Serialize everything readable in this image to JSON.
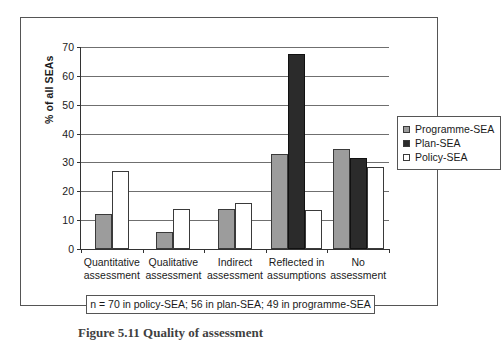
{
  "figure": {
    "caption": "Figure 5.11  Quality of assessment"
  },
  "footnote": {
    "text": "n = 70 in policy-SEA; 56 in plan-SEA; 49 in programme-SEA"
  },
  "legend": {
    "position": "right",
    "items": [
      {
        "label": "Programme-SEA",
        "color": "#9c9c9c",
        "key": "programme"
      },
      {
        "label": "Plan-SEA",
        "color": "#2b2b2b",
        "key": "plan"
      },
      {
        "label": "Policy-SEA",
        "color": "#ffffff",
        "key": "policy"
      }
    ]
  },
  "axes": {
    "y_title": "% of all SEAs",
    "y_ticks": [
      0,
      10,
      20,
      30,
      40,
      50,
      60,
      70
    ]
  },
  "chart_data": {
    "type": "bar",
    "title": "",
    "xlabel": "",
    "ylabel": "% of all SEAs",
    "ylim": [
      0,
      70
    ],
    "ytick_step": 10,
    "grid": true,
    "legend_position": "right",
    "categories": [
      "Quantitative\nassessment",
      "Qualitative\nassessment",
      "Indirect\nassessment",
      "Reflected in\nassumptions",
      "No\nassessment"
    ],
    "category_lines": [
      [
        "Quantitative",
        "assessment"
      ],
      [
        "Qualitative",
        "assessment"
      ],
      [
        "Indirect",
        "assessment"
      ],
      [
        "Reflected in",
        "assumptions"
      ],
      [
        "No",
        "assessment"
      ]
    ],
    "series": [
      {
        "name": "Programme-SEA",
        "color": "#9c9c9c",
        "values": [
          12,
          6,
          14,
          33,
          34.5
        ]
      },
      {
        "name": "Plan-SEA",
        "color": "#2b2b2b",
        "values": [
          null,
          null,
          null,
          67.5,
          31.5
        ]
      },
      {
        "name": "Policy-SEA",
        "color": "#ffffff",
        "values": [
          27,
          14,
          16,
          13.5,
          28.5
        ]
      }
    ],
    "note": "n = 70 in policy-SEA; 56 in plan-SEA; 49 in programme-SEA"
  }
}
